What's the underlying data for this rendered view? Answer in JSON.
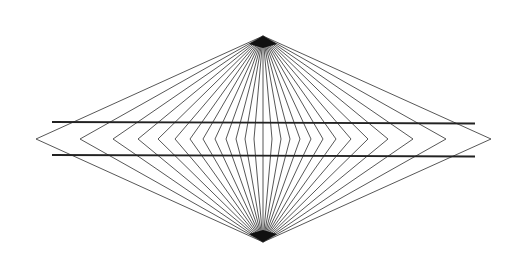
{
  "figure": {
    "background": "#ffffff",
    "line_color": "#444444",
    "bar_color": "#222222"
  },
  "geometry": {
    "top_apex": [
      263,
      36
    ],
    "bottom_apex": [
      263,
      242
    ],
    "mid_y": 139,
    "vertex_x": [
      36,
      80,
      113,
      138,
      158,
      175,
      190,
      203,
      215,
      226,
      236,
      245,
      254,
      263,
      272,
      281,
      290,
      300,
      311,
      323,
      336,
      351,
      368,
      388,
      413,
      446,
      491
    ],
    "horizontal_lines": [
      {
        "x1": 52,
        "y1": 122,
        "x2": 475,
        "y2": 123.5
      },
      {
        "x1": 52,
        "y1": 155,
        "x2": 475,
        "y2": 156.5
      }
    ]
  }
}
